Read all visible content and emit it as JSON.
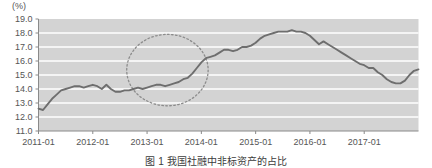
{
  "figure": {
    "unit_label": "(%)",
    "caption": "图 1  我国社融中非标资产的占比"
  },
  "chart_data": {
    "type": "line",
    "title": "",
    "subtitle": "",
    "xlabel": "",
    "ylabel": "",
    "unit": "(%)",
    "ylim": [
      11.0,
      19.0
    ],
    "ytick_labels": [
      "19.0",
      "18.0",
      "17.0",
      "16.0",
      "15.0",
      "14.0",
      "13.0",
      "12.0",
      "11.0"
    ],
    "ytick_values": [
      19.0,
      18.0,
      17.0,
      16.0,
      15.0,
      14.0,
      13.0,
      12.0,
      11.0
    ],
    "xtick_labels": [
      "2011-01",
      "2012-01",
      "2013-01",
      "2014-01",
      "2015-01",
      "2016-01",
      "2017-01"
    ],
    "xtick_values": [
      0,
      12,
      24,
      36,
      48,
      60,
      72
    ],
    "xlim": [
      0,
      84
    ],
    "grid": true,
    "grid_color": "#ffffff",
    "plot_background": "#d3d3d3",
    "line_color": "#6e6e6e",
    "legend": null,
    "series": [
      {
        "name": "非标资产占比",
        "x": [
          0,
          1,
          2,
          3,
          4,
          5,
          6,
          7,
          8,
          9,
          10,
          11,
          12,
          13,
          14,
          15,
          16,
          17,
          18,
          19,
          20,
          21,
          22,
          23,
          24,
          25,
          26,
          27,
          28,
          29,
          30,
          31,
          32,
          33,
          34,
          35,
          36,
          37,
          38,
          39,
          40,
          41,
          42,
          43,
          44,
          45,
          46,
          47,
          48,
          49,
          50,
          51,
          52,
          53,
          54,
          55,
          56,
          57,
          58,
          59,
          60,
          61,
          62,
          63,
          64,
          65,
          66,
          67,
          68,
          69,
          70,
          71,
          72,
          73,
          74,
          75,
          76,
          77,
          78,
          79,
          80,
          81,
          82,
          83,
          84
        ],
        "values": [
          12.6,
          12.5,
          12.9,
          13.3,
          13.6,
          13.9,
          14.0,
          14.1,
          14.2,
          14.2,
          14.1,
          14.2,
          14.3,
          14.2,
          14.0,
          14.3,
          14.0,
          13.8,
          13.8,
          13.9,
          13.9,
          14.0,
          14.1,
          14.0,
          14.1,
          14.2,
          14.3,
          14.3,
          14.2,
          14.3,
          14.4,
          14.5,
          14.7,
          14.8,
          15.1,
          15.5,
          15.9,
          16.2,
          16.3,
          16.4,
          16.6,
          16.8,
          16.8,
          16.7,
          16.8,
          17.0,
          17.0,
          17.1,
          17.3,
          17.6,
          17.8,
          17.9,
          18.0,
          18.1,
          18.1,
          18.1,
          18.2,
          18.1,
          18.1,
          18.0,
          17.8,
          17.5,
          17.2,
          17.4,
          17.2,
          17.0,
          16.8,
          16.6,
          16.4,
          16.2,
          16.0,
          15.8,
          15.7,
          15.5,
          15.5,
          15.2,
          15.0,
          14.7,
          14.5,
          14.4,
          14.4,
          14.6,
          15.0,
          15.3,
          15.4
        ]
      }
    ],
    "annotations": [
      {
        "type": "ellipse-highlight",
        "style": "dashed",
        "color": "#8c8c8c",
        "x_center": 28.5,
        "y_center": 15.35,
        "x_radius": 9.0,
        "y_radius": 2.55,
        "label": ""
      }
    ]
  }
}
